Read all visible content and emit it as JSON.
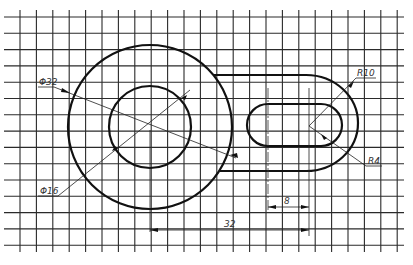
{
  "drawing": {
    "title": "Technical drawing: circle with rounded slot on grid paper",
    "colors": {
      "line": "#111111",
      "grid": "#2a2a2a",
      "paper": "#ffffff",
      "text": "#333333"
    }
  },
  "dimensions": {
    "outer_circle_diameter": "Φ32",
    "inner_circle_diameter": "Φ16",
    "outer_slot_radius": "R10",
    "inner_slot_radius": "R4",
    "slot_offset": "8",
    "center_distance": "32"
  }
}
